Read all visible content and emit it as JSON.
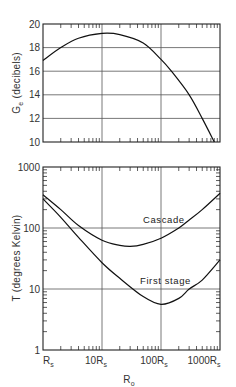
{
  "chart_data": [
    {
      "type": "line",
      "title": "",
      "xlabel": "R_o",
      "ylabel": "G_e (decibels)",
      "xscale": "log",
      "x_units": "multiples of R_s",
      "xlim": [
        1,
        1000
      ],
      "ylim": [
        10,
        20
      ],
      "yticks": [
        10,
        12,
        14,
        16,
        18,
        20
      ],
      "grid": true,
      "series": [
        {
          "name": "G_e",
          "x": [
            1,
            2,
            4,
            10,
            20,
            50,
            100,
            150,
            300,
            500,
            800
          ],
          "values": [
            16.9,
            18.0,
            18.8,
            19.2,
            19.1,
            18.4,
            17.0,
            16.0,
            14.0,
            12.0,
            10.0
          ]
        }
      ]
    },
    {
      "type": "line",
      "title": "",
      "xlabel": "R_o",
      "ylabel": "T (degrees Kelvin)",
      "xscale": "log",
      "yscale": "log",
      "xlim": [
        1,
        1000
      ],
      "ylim": [
        1,
        1000
      ],
      "xticks": [
        "R_s",
        "10R_s",
        "100R_s",
        "1000R_s"
      ],
      "yticks": [
        1,
        10,
        100,
        1000
      ],
      "grid": true,
      "series": [
        {
          "name": "Cascade",
          "x": [
            1,
            2,
            4,
            10,
            20,
            30,
            50,
            100,
            200,
            300,
            500,
            1000
          ],
          "values": [
            350,
            200,
            110,
            63,
            52,
            50,
            54,
            68,
            100,
            135,
            200,
            370
          ]
        },
        {
          "name": "First stage",
          "x": [
            1,
            2,
            4,
            10,
            20,
            50,
            100,
            200,
            300,
            500,
            1000
          ],
          "values": [
            300,
            150,
            70,
            27,
            15,
            7.5,
            5.6,
            7.0,
            10,
            14,
            30
          ]
        }
      ]
    }
  ],
  "labels": {
    "top_ylabel_main": "G",
    "top_ylabel_sub": "e",
    "top_ylabel_rest": " (decibels)",
    "bottom_ylabel": "T (degrees Kelvin)",
    "xlabel_main": "R",
    "xlabel_sub": "o",
    "cascade": "Cascade",
    "first_stage": "First stage",
    "top_yticks": [
      "20",
      "18",
      "16",
      "14",
      "12",
      "10"
    ],
    "bottom_yticks": [
      "1000",
      "100",
      "10",
      "1"
    ],
    "xticks": [
      {
        "main": "R",
        "sub": "s"
      },
      {
        "main": "10R",
        "sub": "s"
      },
      {
        "main": "100R",
        "sub": "s"
      },
      {
        "main": "1000R",
        "sub": "s"
      }
    ]
  }
}
